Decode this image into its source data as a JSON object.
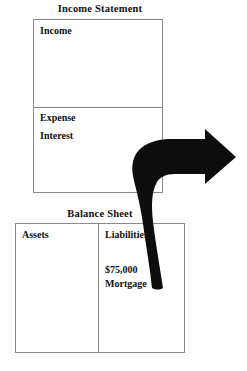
{
  "diagram": {
    "income_statement": {
      "title": "Income Statement",
      "income_label": "Income",
      "expense_label": "Expense",
      "interest_label": "Interest"
    },
    "balance_sheet": {
      "title": "Balance Sheet",
      "assets_label": "Assets",
      "liabilities_label": "Liabilities",
      "mortgage_amount": "$75,000",
      "mortgage_name": "Mortgage"
    },
    "arrow": {
      "icon": "curved-arrow-right-icon",
      "color": "#0d0d0d"
    },
    "colors": {
      "border": "#8a8a8a",
      "text": "#111111",
      "background": "#ffffff",
      "arrow": "#0d0d0d"
    }
  }
}
